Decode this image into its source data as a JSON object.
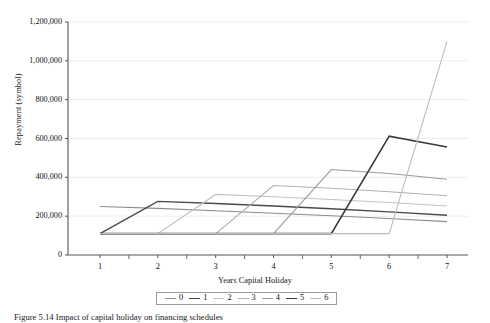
{
  "figure": {
    "caption": "Figure 5.14  Impact of capital holiday on financing schedules — repayment amounts",
    "caption_visible_fragment": "Figure 5.14  Impact of capital holiday on financing schedules"
  },
  "chart_data": {
    "type": "line",
    "title": "",
    "xlabel": "Years Capital Holiday",
    "ylabel": "Repayment (symbol)",
    "x": [
      1,
      2,
      3,
      4,
      5,
      6,
      7
    ],
    "xlim": [
      0.55,
      7.45
    ],
    "ylim": [
      0,
      1200000
    ],
    "xticks": [
      1,
      2,
      3,
      4,
      5,
      6,
      7
    ],
    "yticks": [
      0,
      200000,
      400000,
      600000,
      800000,
      1000000,
      1200000
    ],
    "ytick_labels": [
      "0",
      "200,000",
      "400,000",
      "600,000",
      "800,000",
      "1,000,000",
      "1,200,000"
    ],
    "grid": "horizontal",
    "legend_position": "bottom-center",
    "legend_title": "",
    "series": [
      {
        "name": "0",
        "color": "#8c8c8c",
        "width": 1.1,
        "values": [
          250000,
          240000,
          228000,
          215000,
          202000,
          188000,
          172000
        ]
      },
      {
        "name": "1",
        "color": "#4a4a4a",
        "width": 1.4,
        "values": [
          110000,
          276000,
          265000,
          252000,
          238000,
          222000,
          205000
        ]
      },
      {
        "name": "2",
        "color": "#c2c2c2",
        "width": 1.1,
        "values": [
          110000,
          110000,
          312000,
          300000,
          286000,
          270000,
          252000
        ]
      },
      {
        "name": "3",
        "color": "#b0b0b0",
        "width": 1.1,
        "values": [
          110000,
          110000,
          110000,
          358000,
          344000,
          326000,
          305000
        ]
      },
      {
        "name": "4",
        "color": "#9c9c9c",
        "width": 1.1,
        "values": [
          110000,
          110000,
          110000,
          110000,
          440000,
          420000,
          390000
        ]
      },
      {
        "name": "5",
        "color": "#3a3a3a",
        "width": 1.6,
        "values": [
          110000,
          110000,
          110000,
          110000,
          110000,
          612000,
          556000
        ]
      },
      {
        "name": "6",
        "color": "#bdbdbd",
        "width": 1.1,
        "values": [
          110000,
          110000,
          110000,
          110000,
          110000,
          110000,
          1100000
        ]
      }
    ]
  }
}
